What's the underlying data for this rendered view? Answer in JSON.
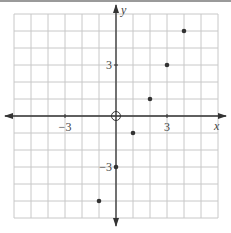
{
  "chart_data": {
    "type": "scatter",
    "title": "",
    "xlabel": "x",
    "ylabel": "y",
    "xlim": [
      -6,
      6
    ],
    "ylim": [
      -6,
      6
    ],
    "grid": true,
    "tick_labels": {
      "x": [
        {
          "value": -3,
          "label": "−3"
        },
        {
          "value": 3,
          "label": "3"
        }
      ],
      "y": [
        {
          "value": 3,
          "label": "3"
        },
        {
          "value": -3,
          "label": "−3"
        }
      ]
    },
    "points": [
      {
        "x": -1,
        "y": -5
      },
      {
        "x": 0,
        "y": -3
      },
      {
        "x": 1,
        "y": -1
      },
      {
        "x": 2,
        "y": 1
      },
      {
        "x": 3,
        "y": 3
      },
      {
        "x": 4,
        "y": 5
      }
    ],
    "annotations": [
      {
        "type": "open-circle",
        "x": 0,
        "y": 0
      }
    ]
  },
  "colors": {
    "grid": "#c8c8c8",
    "axis": "#333333",
    "point": "#333333"
  }
}
